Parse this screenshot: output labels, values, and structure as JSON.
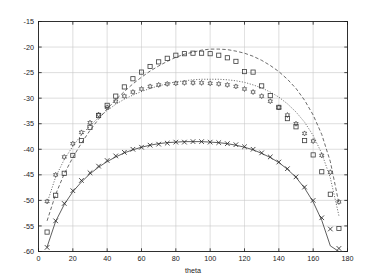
{
  "chart_data": {
    "type": "scatter",
    "title": "",
    "subtitle": "",
    "xlabel": "theta",
    "ylabel": "",
    "xlim": [
      0,
      180
    ],
    "ylim": [
      -60,
      -15
    ],
    "xticks": [
      0,
      20,
      40,
      60,
      80,
      100,
      120,
      140,
      160,
      180
    ],
    "yticks": [
      -60,
      -55,
      -50,
      -45,
      -40,
      -35,
      -30,
      -25,
      -20,
      -15
    ],
    "xticklabels": [
      "0",
      "20",
      "40",
      "60",
      "80",
      "100",
      "120",
      "140",
      "160",
      "180"
    ],
    "yticklabels": [
      "-60",
      "-55",
      "-50",
      "-45",
      "-40",
      "-35",
      "-30",
      "-25",
      "-20",
      "-15"
    ],
    "grid": true,
    "legend": "none",
    "background": "#ffffff",
    "axis_color": "#1a1a1a",
    "grid_color": "#c8c8c8",
    "x": [
      5,
      10,
      15,
      20,
      25,
      30,
      35,
      40,
      45,
      50,
      55,
      60,
      65,
      70,
      75,
      80,
      85,
      90,
      95,
      100,
      105,
      110,
      115,
      120,
      125,
      130,
      135,
      140,
      145,
      150,
      155,
      160,
      165,
      170,
      175
    ],
    "series": [
      {
        "name": "series-squares",
        "marker": "square",
        "line": "dashed",
        "color": "#3c3c3c",
        "values": [
          -56.2,
          -49.0,
          -44.7,
          -41.2,
          -38.3,
          -35.7,
          -33.4,
          -31.4,
          -29.6,
          -27.8,
          -26.2,
          -24.9,
          -23.8,
          -22.9,
          -22.2,
          -21.6,
          -21.3,
          -21.2,
          -21.2,
          -21.3,
          -21.6,
          -22.1,
          -22.8,
          -24.8,
          -24.9,
          -27.6,
          -29.5,
          -31.8,
          -34.0,
          -35.6,
          -38.3,
          -41.1,
          -44.4,
          -48.8,
          -55.5
        ],
        "fit_values": [
          -54.0,
          -48.8,
          -44.8,
          -41.6,
          -38.8,
          -36.3,
          -34.1,
          -32.1,
          -30.3,
          -28.7,
          -27.2,
          -25.9,
          -24.7,
          -23.7,
          -22.8,
          -22.0,
          -21.4,
          -21.0,
          -20.6,
          -20.4,
          -20.4,
          -20.5,
          -20.8,
          -21.2,
          -21.8,
          -22.6,
          -23.6,
          -24.8,
          -26.3,
          -28.1,
          -30.4,
          -33.3,
          -37.1,
          -42.4,
          -50.6
        ]
      },
      {
        "name": "series-circles",
        "marker": "hexagram",
        "line": "dotted",
        "color": "#3c3c3c",
        "values": [
          -50.2,
          -45.0,
          -41.5,
          -38.9,
          -36.7,
          -34.8,
          -33.2,
          -31.8,
          -30.6,
          -29.6,
          -28.8,
          -28.2,
          -27.7,
          -27.4,
          -27.2,
          -27.1,
          -27.0,
          -27.0,
          -27.0,
          -27.1,
          -27.2,
          -27.4,
          -27.7,
          -28.2,
          -28.8,
          -29.6,
          -30.6,
          -31.8,
          -33.3,
          -35.0,
          -36.9,
          -38.4,
          -41.2,
          -44.5,
          -50.3
        ],
        "fit_values": [
          -50.5,
          -45.4,
          -42.0,
          -39.4,
          -37.2,
          -35.4,
          -33.8,
          -32.4,
          -31.2,
          -30.2,
          -29.4,
          -28.7,
          -28.1,
          -27.6,
          -27.2,
          -26.8,
          -26.6,
          -26.4,
          -26.3,
          -26.3,
          -26.3,
          -26.4,
          -26.6,
          -26.9,
          -27.4,
          -28.0,
          -28.8,
          -29.8,
          -31.1,
          -32.7,
          -34.7,
          -37.3,
          -40.8,
          -45.6,
          -53.0
        ]
      },
      {
        "name": "series-crosses",
        "marker": "cross",
        "line": "solid",
        "color": "#2a2a2a",
        "values": [
          -59.2,
          -54.0,
          -50.6,
          -48.1,
          -46.1,
          -44.6,
          -43.3,
          -42.2,
          -41.3,
          -40.6,
          -40.0,
          -39.6,
          -39.2,
          -39.0,
          -38.8,
          -38.6,
          -38.6,
          -38.5,
          -38.5,
          -38.6,
          -38.7,
          -38.9,
          -39.1,
          -39.5,
          -40.0,
          -40.7,
          -41.5,
          -42.5,
          -43.8,
          -45.4,
          -47.4,
          -50.0,
          -53.4,
          -55.6,
          -59.4
        ],
        "fit_values": [
          -59.1,
          -54.1,
          -50.8,
          -48.3,
          -46.4,
          -44.8,
          -43.5,
          -42.4,
          -41.5,
          -40.7,
          -40.1,
          -39.6,
          -39.2,
          -38.9,
          -38.7,
          -38.6,
          -38.5,
          -38.5,
          -38.5,
          -38.6,
          -38.7,
          -38.9,
          -39.2,
          -39.6,
          -40.1,
          -40.8,
          -41.6,
          -42.6,
          -43.9,
          -45.5,
          -47.6,
          -50.3,
          -53.9,
          -58.9,
          -60.0
        ]
      }
    ]
  }
}
